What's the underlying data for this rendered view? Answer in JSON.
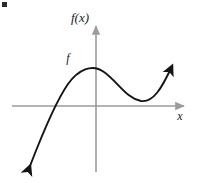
{
  "figure": {
    "name": "cubic-function-graph",
    "background_color": "#ffffff",
    "corner_mark": {
      "name": "corner-mark",
      "x": 2,
      "y": 2,
      "width": 5,
      "height": 5,
      "color": "#2b2b2b"
    },
    "axes": {
      "color": "#9b9b9b",
      "stroke_width": 1.6,
      "origin": {
        "x": 96,
        "y": 106
      },
      "x_axis": {
        "x_start": 12,
        "x_end": 188,
        "y": 106,
        "arrow": "right"
      },
      "y_axis": {
        "y_start": 22,
        "y_end": 172,
        "x": 96,
        "arrow": "up"
      }
    },
    "curve": {
      "color": "#141414",
      "stroke_width": 1.9,
      "arrow_start": "down-left",
      "arrow_end": "up-right",
      "path": "M 30,166 C 40,140 54,104 68,84 C 78,70 92,63 104,72 C 118,82 126,98 141,101 C 153,103 162,88 172,66",
      "x_intercept": {
        "x": 44,
        "y": 106
      },
      "local_maximum": {
        "x": 85,
        "y": 68
      },
      "local_minimum": {
        "x": 143,
        "y": 101
      }
    },
    "labels": {
      "y_axis_label": {
        "text": "f(x)",
        "x": 80,
        "y": 22
      },
      "x_axis_label": {
        "text": "x",
        "x": 180,
        "y": 120
      },
      "curve_label": {
        "text": "f",
        "x": 68,
        "y": 62
      }
    }
  },
  "chart_data": {
    "type": "line",
    "title": "",
    "xlabel": "x",
    "ylabel": "f(x)",
    "legend": [
      "f"
    ],
    "legend_position": "inline-near-local-maximum",
    "grid": false,
    "axis_arrows": {
      "x": "right-only",
      "y": "up-only"
    },
    "tick_labels": {
      "x": [],
      "y": []
    },
    "series": [
      {
        "name": "f",
        "x": [
          -3.3,
          -2.6,
          -2.1,
          -1.6,
          -1.1,
          -0.6,
          -0.2,
          0.2,
          0.6,
          1.1,
          1.6,
          2.1,
          2.6,
          3.2
        ],
        "y": [
          -3.0,
          -2.0,
          -1.2,
          -0.5,
          0.4,
          0.9,
          1.0,
          0.9,
          0.6,
          0.3,
          0.1,
          0.1,
          0.6,
          1.6
        ]
      }
    ],
    "features": [
      {
        "kind": "x-intercept",
        "x": -1.3,
        "y": 0
      },
      {
        "kind": "local-maximum",
        "x": -0.25,
        "y": 1.0
      },
      {
        "kind": "local-minimum",
        "x": 1.9,
        "y": 0.1
      }
    ],
    "xlim": [
      -3.5,
      3.6
    ],
    "ylim": [
      -3.3,
      2.0
    ]
  }
}
